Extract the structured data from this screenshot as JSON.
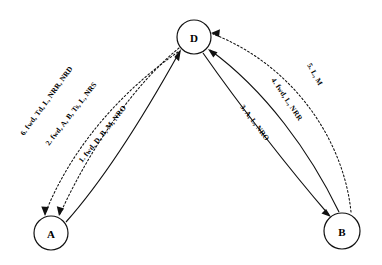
{
  "diagram": {
    "background_color": "#ffffff",
    "stroke_color": "#111111",
    "nodes": [
      {
        "id": "A",
        "label": "A",
        "cx": 51,
        "cy": 233,
        "r": 17
      },
      {
        "id": "D",
        "label": "D",
        "cx": 194,
        "cy": 37,
        "r": 17
      },
      {
        "id": "B",
        "label": "B",
        "cx": 342,
        "cy": 231,
        "r": 18
      }
    ],
    "edges": [
      {
        "step": "1",
        "label": "1. fwd, D, B, M, NRO",
        "from": "A",
        "to": "D",
        "style": "solid",
        "arrow_at": "D"
      },
      {
        "step": "2",
        "label": "2. fwd, A, B, Ts, L, NRS",
        "from": "D",
        "to": "A",
        "style": "dotted",
        "arrow_at": "A"
      },
      {
        "step": "3",
        "label": "3. A, L, NRO",
        "from": "D",
        "to": "B",
        "style": "solid",
        "arrow_at": "B"
      },
      {
        "step": "4",
        "label": "4. fwd, L, NRR",
        "from": "B",
        "to": "D",
        "style": "solid",
        "arrow_at": "D"
      },
      {
        "step": "5",
        "label": "5. L, M",
        "from": "B",
        "to": "D",
        "style": "dotted",
        "arrow_at": "D"
      },
      {
        "step": "6",
        "label": "6. fwd, Td, L, NRR, NRD",
        "from": "D",
        "to": "A",
        "style": "dotted",
        "arrow_at": "A"
      }
    ]
  }
}
